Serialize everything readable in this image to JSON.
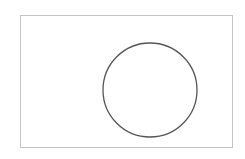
{
  "diagram": {
    "background": "#ffffff",
    "frame": {
      "x": 20.5,
      "y": 15.5,
      "width": 212,
      "height": 132,
      "stroke": "#c4c4c4",
      "stroke_width": 1
    },
    "circle": {
      "cx": 150,
      "cy": 90,
      "r": 47,
      "stroke": "#555555",
      "stroke_width": 1.3,
      "fill": "none"
    }
  }
}
